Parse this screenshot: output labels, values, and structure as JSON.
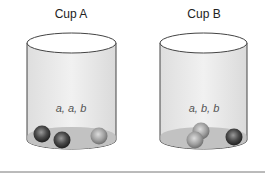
{
  "cups": [
    {
      "title": "Cup A",
      "contents_label": "a, a, b",
      "balls": [
        "a",
        "a",
        "b"
      ]
    },
    {
      "title": "Cup B",
      "contents_label": "a, b, b",
      "balls": [
        "a",
        "b",
        "b"
      ]
    }
  ],
  "colors": {
    "ball_dark": "#3a3a3a",
    "ball_light": "#9a9a9a",
    "cup_body": "#e8e8e8",
    "cup_outline": "#444444",
    "cup_bottom_fill": "#c8c8c8",
    "baseline": "#777777"
  }
}
